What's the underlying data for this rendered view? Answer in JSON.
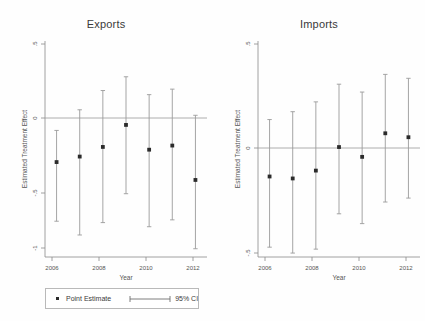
{
  "figure": {
    "background": "#fefefe",
    "point_color": "#2b2b2b",
    "ci_color": "#9b9b9b",
    "axis_color": "#8c8c8c"
  },
  "legend": {
    "point_estimate_label": "Point Estimate",
    "ci_label": "95% CI"
  },
  "chart_data": [
    {
      "type": "scatter",
      "title": "Exports",
      "xlabel": "Year",
      "ylabel": "Estimated Treatment Effect",
      "x": [
        2006,
        2007,
        2008,
        2009,
        2010,
        2011,
        2012
      ],
      "xlim": [
        2005.5,
        2012.5
      ],
      "xticks": [
        2006,
        2008,
        2010,
        2012
      ],
      "xticklabels": [
        "2006",
        "2008",
        "2010",
        "2012"
      ],
      "ylim": [
        -1.05,
        0.52
      ],
      "yticks": [
        0.5,
        0,
        -0.5,
        -1
      ],
      "yticklabels": [
        ".5",
        "0",
        "-.5",
        "-1"
      ],
      "grid": false,
      "zero_line": 0,
      "legend_position": "bottom",
      "series": [
        {
          "name": "Point Estimate",
          "values": [
            -0.36,
            -0.32,
            -0.25,
            -0.09,
            -0.27,
            -0.24,
            -0.49
          ]
        },
        {
          "name": "95% CI lower",
          "values": [
            -0.79,
            -0.89,
            -0.8,
            -0.59,
            -0.83,
            -0.78,
            -0.99
          ]
        },
        {
          "name": "95% CI upper",
          "values": [
            -0.13,
            0.02,
            0.16,
            0.26,
            0.13,
            0.17,
            -0.02
          ]
        }
      ]
    },
    {
      "type": "scatter",
      "title": "Imports",
      "xlabel": "Year",
      "ylabel": "Estimated Treatment Effect",
      "x": [
        2006,
        2007,
        2008,
        2009,
        2010,
        2011,
        2012
      ],
      "xlim": [
        2005.5,
        2012.5
      ],
      "xticks": [
        2006,
        2008,
        2010,
        2012
      ],
      "xticklabels": [
        "2006",
        "2008",
        "2010",
        "2012"
      ],
      "ylim": [
        -0.58,
        0.52
      ],
      "yticks": [
        0.5,
        0,
        -0.5
      ],
      "yticklabels": [
        ".5",
        "0",
        "-.5"
      ],
      "grid": false,
      "zero_line": 0,
      "legend_position": "bottom",
      "series": [
        {
          "name": "Point Estimate",
          "values": [
            -0.17,
            -0.18,
            -0.14,
            -0.02,
            -0.07,
            0.05,
            0.03
          ]
        },
        {
          "name": "95% CI lower",
          "values": [
            -0.53,
            -0.56,
            -0.54,
            -0.36,
            -0.41,
            -0.3,
            -0.28
          ]
        },
        {
          "name": "95% CI upper",
          "values": [
            0.12,
            0.16,
            0.21,
            0.3,
            0.26,
            0.35,
            0.33
          ]
        }
      ]
    }
  ]
}
